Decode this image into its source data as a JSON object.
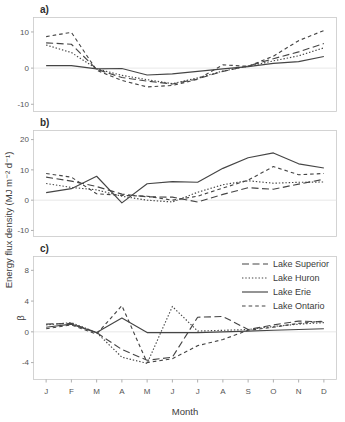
{
  "figure": {
    "ylabel": "Energy flux density (MJ m⁻² d⁻¹)",
    "xlabel": "Month",
    "beta_label": "β"
  },
  "legend": {
    "position": "top-right-panel-c",
    "items": [
      {
        "label": "Lake Superior",
        "style": "long-dash"
      },
      {
        "label": "Lake Huron",
        "style": "dotted"
      },
      {
        "label": "Lake Erie",
        "style": "solid"
      },
      {
        "label": "Lake Ontario",
        "style": "short-dash"
      }
    ]
  },
  "panels": [
    {
      "id": "a",
      "label": "a)"
    },
    {
      "id": "b",
      "label": "b)"
    },
    {
      "id": "c",
      "label": "c)"
    }
  ],
  "chart_data": [
    {
      "type": "line",
      "panel": "a",
      "title": "a)",
      "xlabel": "",
      "ylabel": "Energy flux density (MJ m⁻² d⁻¹)",
      "categories": [
        "J",
        "F",
        "M",
        "A",
        "M",
        "J",
        "J",
        "A",
        "S",
        "O",
        "N",
        "D"
      ],
      "ylim": [
        -12,
        14
      ],
      "yticks": [
        -10,
        0,
        10
      ],
      "grid": false,
      "series": [
        {
          "name": "Lake Superior",
          "values": [
            7.0,
            6.6,
            -0.3,
            -2.6,
            -3.6,
            -4.4,
            -3.0,
            -0.9,
            0.6,
            2.6,
            4.5,
            6.8
          ]
        },
        {
          "name": "Lake Huron",
          "values": [
            6.4,
            4.3,
            -0.2,
            -2.0,
            -3.2,
            -4.3,
            -2.7,
            -0.8,
            0.5,
            2.0,
            3.4,
            5.6
          ]
        },
        {
          "name": "Lake Erie",
          "values": [
            0.7,
            0.7,
            -0.2,
            -0.1,
            -1.9,
            -1.6,
            -0.9,
            -0.2,
            0.4,
            1.3,
            1.8,
            3.2
          ]
        },
        {
          "name": "Lake Ontario",
          "values": [
            8.7,
            9.9,
            -0.6,
            -3.4,
            -5.2,
            -4.8,
            -3.1,
            0.9,
            0.5,
            3.3,
            7.6,
            10.4
          ]
        }
      ]
    },
    {
      "type": "line",
      "panel": "b",
      "title": "b)",
      "xlabel": "",
      "ylabel": "Energy flux density (MJ m⁻² d⁻¹)",
      "categories": [
        "J",
        "F",
        "M",
        "A",
        "M",
        "J",
        "J",
        "A",
        "S",
        "O",
        "N",
        "D"
      ],
      "ylim": [
        -12,
        23
      ],
      "yticks": [
        -10,
        0,
        10,
        20
      ],
      "grid": false,
      "series": [
        {
          "name": "Lake Superior",
          "values": [
            7.6,
            6.3,
            4.5,
            2.0,
            1.1,
            1.0,
            -0.6,
            1.9,
            4.1,
            3.6,
            5.3,
            6.9
          ]
        },
        {
          "name": "Lake Huron",
          "values": [
            5.5,
            4.2,
            3.4,
            1.3,
            0.0,
            -0.6,
            2.6,
            5.1,
            6.4,
            5.6,
            5.9,
            6.0
          ]
        },
        {
          "name": "Lake Erie",
          "values": [
            2.5,
            3.8,
            7.9,
            -0.9,
            5.4,
            6.1,
            5.9,
            10.5,
            14.0,
            15.6,
            12.0,
            10.6
          ]
        },
        {
          "name": "Lake Ontario",
          "values": [
            8.8,
            7.6,
            2.1,
            1.6,
            1.3,
            0.0,
            1.3,
            4.0,
            6.6,
            11.1,
            8.4,
            8.8
          ]
        }
      ]
    },
    {
      "type": "line",
      "panel": "c",
      "title": "c)",
      "xlabel": "Month",
      "ylabel": "β",
      "categories": [
        "J",
        "F",
        "M",
        "A",
        "M",
        "J",
        "J",
        "A",
        "S",
        "O",
        "N",
        "D"
      ],
      "ylim": [
        -6.2,
        9.8
      ],
      "yticks": [
        -4,
        0,
        4,
        8
      ],
      "grid": false,
      "series": [
        {
          "name": "Lake Superior",
          "values": [
            1.0,
            1.1,
            -0.1,
            -2.3,
            -3.7,
            -3.3,
            1.9,
            2.0,
            0.3,
            0.9,
            1.4,
            1.3
          ]
        },
        {
          "name": "Lake Huron",
          "values": [
            0.9,
            1.2,
            -0.1,
            -3.3,
            -4.1,
            3.3,
            0.1,
            0.2,
            0.3,
            0.7,
            1.0,
            1.2
          ]
        },
        {
          "name": "Lake Erie",
          "values": [
            0.6,
            1.0,
            -0.1,
            1.8,
            -0.1,
            -0.1,
            -0.1,
            0.0,
            0.1,
            0.2,
            0.3,
            0.4
          ]
        },
        {
          "name": "Lake Ontario",
          "values": [
            0.4,
            0.9,
            -0.3,
            3.4,
            -4.0,
            -3.5,
            -1.8,
            -1.0,
            0.2,
            0.6,
            1.1,
            1.4
          ]
        }
      ]
    }
  ]
}
